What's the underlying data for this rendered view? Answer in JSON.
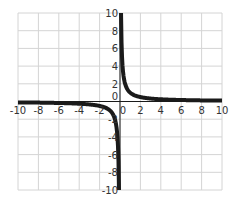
{
  "chart_data": {
    "type": "line",
    "title": "",
    "xlabel": "",
    "ylabel": "",
    "function": "y = 1/x",
    "xlim": [
      -10,
      10
    ],
    "ylim": [
      -10,
      10
    ],
    "grid": true,
    "x_ticks": [
      "-10",
      "-8",
      "-6",
      "-4",
      "-2",
      "0",
      "2",
      "4",
      "6",
      "8",
      "10"
    ],
    "y_ticks": [
      "10",
      "8",
      "6",
      "4",
      "2",
      "0",
      "-2",
      "-4",
      "-6",
      "-8",
      "-10"
    ],
    "series": [
      {
        "name": "branch-positive",
        "x": [
          0.1,
          0.2,
          0.3,
          0.5,
          0.75,
          1,
          1.5,
          2,
          3,
          4,
          5,
          6,
          8,
          10
        ],
        "y": [
          10,
          5,
          3.33,
          2,
          1.33,
          1,
          0.67,
          0.5,
          0.33,
          0.25,
          0.2,
          0.17,
          0.125,
          0.1
        ]
      },
      {
        "name": "branch-negative",
        "x": [
          -10,
          -8,
          -6,
          -5,
          -4,
          -3,
          -2,
          -1.5,
          -1,
          -0.75,
          -0.5,
          -0.3,
          -0.2,
          -0.1
        ],
        "y": [
          -0.1,
          -0.125,
          -0.17,
          -0.2,
          -0.25,
          -0.33,
          -0.5,
          -0.67,
          -1,
          -1.33,
          -2,
          -3.33,
          -5,
          -10
        ]
      }
    ],
    "colors": {
      "curve": "#1a1a1a",
      "grid": "#d4d4d4",
      "axis": "#1a1a1a",
      "background": "#ffffff"
    }
  }
}
